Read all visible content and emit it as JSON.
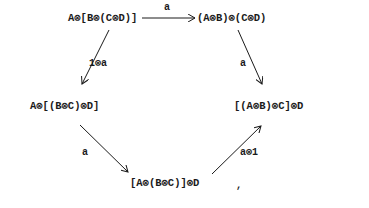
{
  "diagram": {
    "type": "commutative-pentagon",
    "nodes": {
      "top_left": "A⊗[B⊗(C⊗D)]",
      "top_right": "(A⊗B)⊗(C⊗D)",
      "mid_left": "A⊗[(B⊗C)⊗D]",
      "mid_right": "[(A⊗B)⊗C]⊗D",
      "bottom": "[A⊗(B⊗C)]⊗D"
    },
    "arrows": {
      "top": {
        "from": "top_left",
        "to": "top_right",
        "label": "a"
      },
      "right": {
        "from": "top_right",
        "to": "mid_right",
        "label": "a"
      },
      "left": {
        "from": "top_left",
        "to": "mid_left",
        "label": "1⊗a"
      },
      "lower_left": {
        "from": "mid_left",
        "to": "bottom",
        "label": "a"
      },
      "lower_right": {
        "from": "bottom",
        "to": "mid_right",
        "label": "a⊗1"
      }
    },
    "trailing_punctuation": ","
  },
  "colors": {
    "ink": "#1a1a1a",
    "background": "#ffffff"
  }
}
